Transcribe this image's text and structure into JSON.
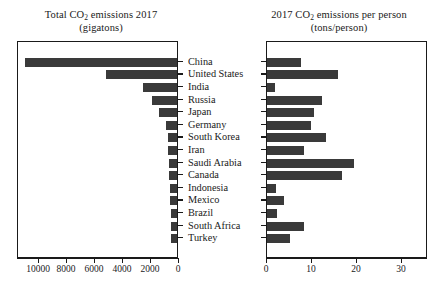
{
  "chart_data": {
    "type": "bar",
    "orientation": "horizontal",
    "grid": false,
    "legend": null,
    "categories": [
      "China",
      "United States",
      "India",
      "Russia",
      "Japan",
      "Germany",
      "South Korea",
      "Iran",
      "Saudi Arabia",
      "Canada",
      "Indonesia",
      "Mexico",
      "Brazil",
      "South Africa",
      "Turkey"
    ],
    "panels": [
      {
        "id": "total",
        "title_line1": "Total CO2 emissions 2017",
        "title_line2": "(gigatons)",
        "xlabel": "",
        "ylabel": "",
        "direction": "right-to-left",
        "xlim": [
          0,
          11500
        ],
        "xticks": [
          10000,
          8000,
          6000,
          4000,
          2000,
          0
        ],
        "values": [
          10877,
          5107,
          2455,
          1765,
          1321,
          799,
          673,
          630,
          571,
          560,
          514,
          466,
          453,
          448,
          402
        ]
      },
      {
        "id": "per-person",
        "title_line1": "2017 CO2 emissions per person",
        "title_line2": "(tons/person)",
        "xlabel": "",
        "ylabel": "",
        "direction": "left-to-right",
        "xlim": [
          0,
          35.8
        ],
        "xticks": [
          0,
          10,
          20,
          30
        ],
        "values": [
          7.5,
          15.7,
          1.8,
          12.2,
          10.4,
          9.7,
          13.1,
          8.2,
          19.4,
          16.7,
          1.9,
          3.7,
          2.2,
          8.3,
          5.2
        ]
      }
    ]
  },
  "titles": {
    "left": {
      "pre": "Total CO",
      "sub": "2",
      "post": " emissions 2017",
      "line2": "(gigatons)"
    },
    "right": {
      "pre": "2017 CO",
      "sub": "2",
      "post": " emissions per person",
      "line2": "(tons/person)"
    }
  },
  "colors": {
    "bar": "#3a3a3a",
    "axis": "#1a1a1a",
    "background": "#ffffff"
  }
}
